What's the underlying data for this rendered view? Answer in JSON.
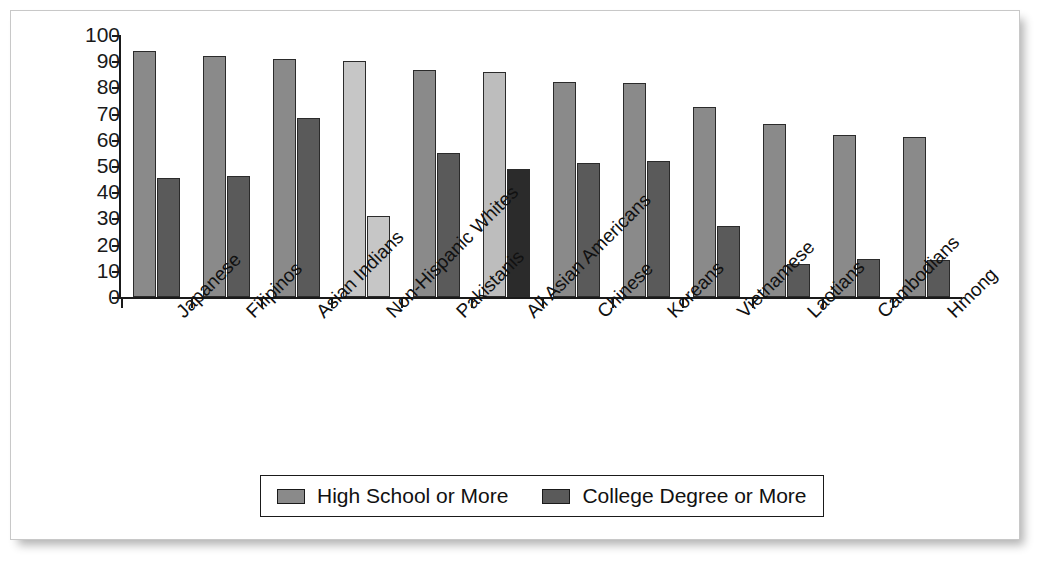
{
  "chart_data": {
    "type": "bar",
    "title": "",
    "xlabel": "",
    "ylabel": "",
    "ylim": [
      0,
      100
    ],
    "yticks": [
      100,
      90,
      80,
      70,
      60,
      50,
      40,
      30,
      20,
      10,
      0
    ],
    "grid": false,
    "legend_position": "bottom-center",
    "categories": [
      "Japanese",
      "Filipinos",
      "Asian Indians",
      "Non-Hispanic Whites",
      "Pakistanis",
      "All Asian Americans",
      "Chinese",
      "Koreans",
      "Vietnamese",
      "Laotians",
      "Cambodians",
      "Hmong"
    ],
    "series": [
      {
        "name": "High School or More",
        "color": "#8a8a8a",
        "values": [
          94,
          92,
          91,
          90,
          86.5,
          86,
          82,
          81.5,
          72.5,
          66,
          62,
          61
        ],
        "highlight_colors": {
          "3": "#c6c6c6",
          "5": "#bdbdbd"
        }
      },
      {
        "name": "College Degree or More",
        "color": "#5a5a5a",
        "values": [
          45.5,
          46,
          68.5,
          31,
          55,
          49,
          51,
          52,
          27,
          12.5,
          14.5,
          14
        ],
        "highlight_colors": {
          "3": "#c6c6c6",
          "5": "#2b2b2b"
        }
      }
    ]
  },
  "legend": {
    "items": [
      {
        "label": "High School or More",
        "color": "#8a8a8a"
      },
      {
        "label": "College Degree or More",
        "color": "#5a5a5a"
      }
    ]
  },
  "colors": {
    "series1": "#8a8a8a",
    "series2": "#5a5a5a",
    "highlight_light": "#c6c6c6",
    "highlight_dark": "#2b2b2b",
    "bar_border": "#2b2b2b",
    "axis": "#1a1a1a",
    "frame": "#c8c8c8"
  }
}
